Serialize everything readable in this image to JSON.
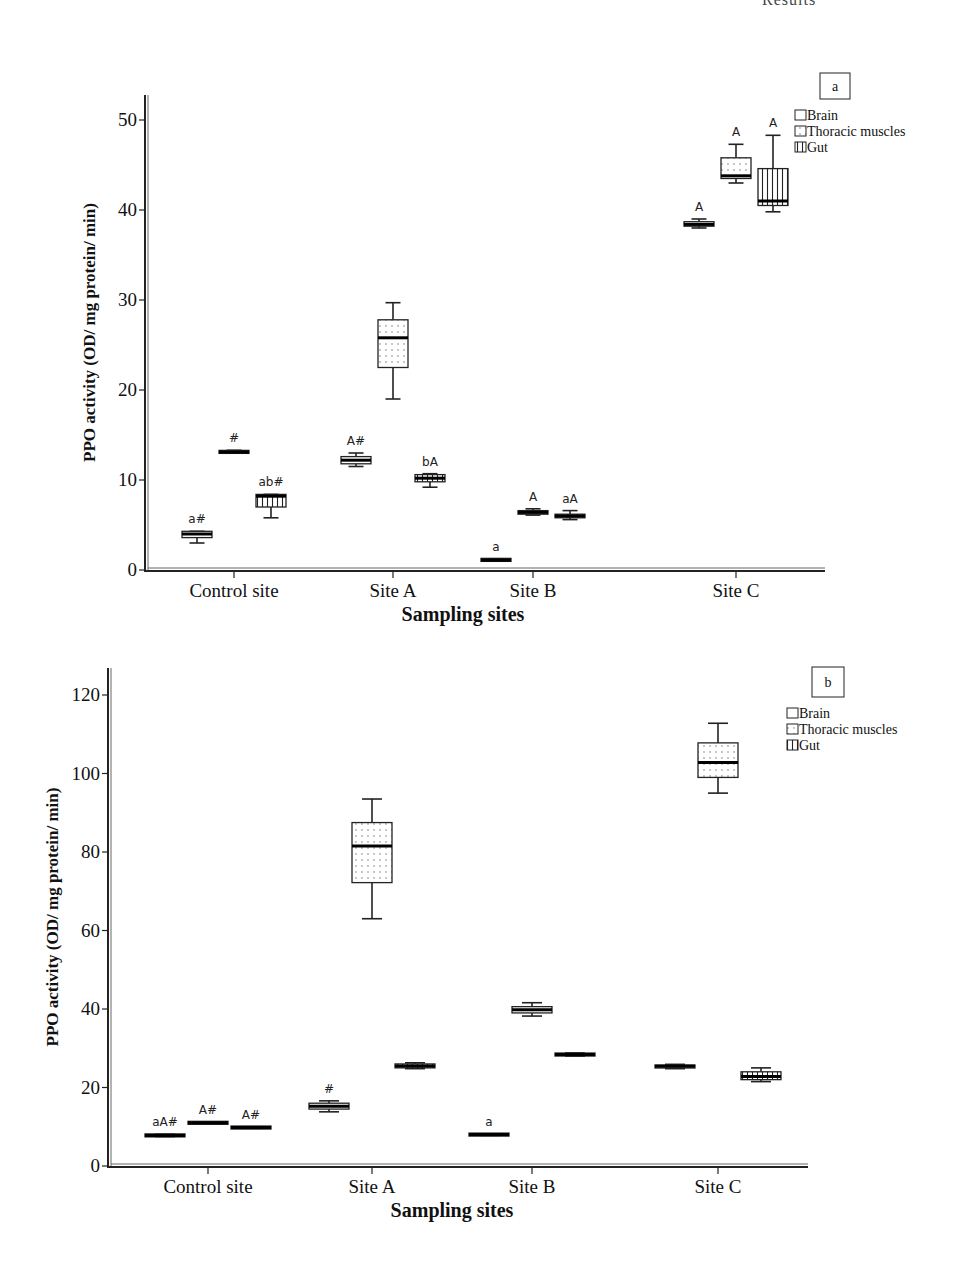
{
  "top_fragment": "Results",
  "chart_data": [
    {
      "panel": "a",
      "type": "box",
      "title": "",
      "xlabel": "Sampling sites",
      "ylabel": "PPO activity (OD/ mg protein/ min)",
      "ylim": [
        0,
        52
      ],
      "yticks": [
        0,
        10,
        20,
        30,
        40,
        50
      ],
      "categories": [
        "Control site",
        "Site A",
        "Site B",
        "Site C"
      ],
      "legend": [
        "Brain",
        "Thoracic muscles",
        "Gut"
      ],
      "legend_position": "upper right",
      "grid": false,
      "series": [
        {
          "name": "Brain",
          "pattern": "plain",
          "boxes": [
            {
              "category": "Control site",
              "min": 3.0,
              "q1": 3.6,
              "median": 4.0,
              "q3": 4.3,
              "max": 4.3,
              "annotation": "a#"
            },
            {
              "category": "Site A",
              "min": 11.5,
              "q1": 11.8,
              "median": 12.2,
              "q3": 12.6,
              "max": 13.0,
              "annotation": "A#"
            },
            {
              "category": "Site B",
              "min": 1.0,
              "q1": 1.05,
              "median": 1.1,
              "q3": 1.2,
              "max": 1.25,
              "annotation": "a"
            },
            {
              "category": "Site C",
              "min": 38.0,
              "q1": 38.2,
              "median": 38.4,
              "q3": 38.7,
              "max": 39.0,
              "annotation": "A"
            }
          ]
        },
        {
          "name": "Thoracic muscles",
          "pattern": "dotted",
          "boxes": [
            {
              "category": "Control site",
              "min": 13.0,
              "q1": 13.05,
              "median": 13.1,
              "q3": 13.2,
              "max": 13.3,
              "annotation": "#"
            },
            {
              "category": "Site A",
              "min": 19.0,
              "q1": 22.5,
              "median": 25.8,
              "q3": 27.8,
              "max": 29.7,
              "annotation": ""
            },
            {
              "category": "Site B",
              "min": 6.1,
              "q1": 6.2,
              "median": 6.4,
              "q3": 6.6,
              "max": 6.8,
              "annotation": "A"
            },
            {
              "category": "Site C",
              "min": 43.0,
              "q1": 43.5,
              "median": 43.8,
              "q3": 45.8,
              "max": 47.3,
              "annotation": "A"
            }
          ]
        },
        {
          "name": "Gut",
          "pattern": "vertical-lines",
          "boxes": [
            {
              "category": "Control site",
              "min": 5.8,
              "q1": 7.0,
              "median": 8.2,
              "q3": 8.4,
              "max": 8.4,
              "annotation": "ab#"
            },
            {
              "category": "Site A",
              "min": 9.2,
              "q1": 9.8,
              "median": 10.2,
              "q3": 10.6,
              "max": 10.7,
              "annotation": "bA"
            },
            {
              "category": "Site B",
              "min": 5.6,
              "q1": 5.8,
              "median": 6.0,
              "q3": 6.2,
              "max": 6.6,
              "annotation": "aA"
            },
            {
              "category": "Site C",
              "min": 39.8,
              "q1": 40.5,
              "median": 41.0,
              "q3": 44.6,
              "max": 48.3,
              "annotation": "A"
            }
          ]
        }
      ]
    },
    {
      "panel": "b",
      "type": "box",
      "title": "",
      "xlabel": "Sampling sites",
      "ylabel": "PPO activity (OD/ mg protein/ min)",
      "ylim": [
        0,
        125
      ],
      "yticks": [
        0,
        20,
        40,
        60,
        80,
        100,
        120
      ],
      "categories": [
        "Control site",
        "Site A",
        "Site B",
        "Site C"
      ],
      "legend": [
        "Brain",
        "Thoracic muscles",
        "Gut"
      ],
      "legend_position": "upper right",
      "grid": false,
      "series": [
        {
          "name": "Brain",
          "pattern": "plain",
          "boxes": [
            {
              "category": "Control site",
              "min": 7.5,
              "q1": 7.6,
              "median": 7.8,
              "q3": 8.0,
              "max": 8.1,
              "annotation": "aA#"
            },
            {
              "category": "Site A",
              "min": 13.8,
              "q1": 14.5,
              "median": 15.2,
              "q3": 16.0,
              "max": 16.6,
              "annotation": "#"
            },
            {
              "category": "Site B",
              "min": 7.8,
              "q1": 7.9,
              "median": 8.0,
              "q3": 8.1,
              "max": 8.2,
              "annotation": "a"
            },
            {
              "category": "Site C",
              "min": 24.8,
              "q1": 25.0,
              "median": 25.4,
              "q3": 25.7,
              "max": 25.9,
              "annotation": ""
            }
          ]
        },
        {
          "name": "Thoracic muscles",
          "pattern": "dotted",
          "boxes": [
            {
              "category": "Control site",
              "min": 10.8,
              "q1": 10.9,
              "median": 11.0,
              "q3": 11.1,
              "max": 11.2,
              "annotation": "A#"
            },
            {
              "category": "Site A",
              "min": 63.0,
              "q1": 72.2,
              "median": 81.5,
              "q3": 87.5,
              "max": 93.5,
              "annotation": ""
            },
            {
              "category": "Site B",
              "min": 38.2,
              "q1": 39.0,
              "median": 39.8,
              "q3": 40.6,
              "max": 41.6,
              "annotation": ""
            },
            {
              "category": "Site C",
              "min": 95.0,
              "q1": 99.0,
              "median": 102.8,
              "q3": 107.8,
              "max": 112.8,
              "annotation": ""
            }
          ]
        },
        {
          "name": "Gut",
          "pattern": "vertical-lines",
          "boxes": [
            {
              "category": "Control site",
              "min": 9.6,
              "q1": 9.7,
              "median": 9.8,
              "q3": 9.9,
              "max": 10.0,
              "annotation": "A#"
            },
            {
              "category": "Site A",
              "min": 24.8,
              "q1": 25.0,
              "median": 25.5,
              "q3": 26.0,
              "max": 26.3,
              "annotation": ""
            },
            {
              "category": "Site B",
              "min": 28.0,
              "q1": 28.1,
              "median": 28.4,
              "q3": 28.7,
              "max": 28.8,
              "annotation": ""
            },
            {
              "category": "Site C",
              "min": 21.5,
              "q1": 22.0,
              "median": 22.8,
              "q3": 24.0,
              "max": 25.0,
              "annotation": ""
            }
          ]
        }
      ]
    }
  ],
  "panels": [
    {
      "panel_label": "a",
      "layout": {
        "x0": 145,
        "x1": 825,
        "y0": 570,
        "ymax_px": 120,
        "ymax_val": 50,
        "top": 95,
        "cat_x": [
          234,
          393,
          533,
          736
        ],
        "offsets": [
          -37,
          0,
          37
        ],
        "box_w": 30,
        "label_box": [
          820,
          73,
          30,
          26
        ],
        "legend_xy": [
          795,
          120
        ]
      }
    },
    {
      "panel_label": "b",
      "layout": {
        "x0": 108,
        "x1": 808,
        "y0": 1166,
        "ymax_px": 695,
        "ymax_val": 120,
        "top": 668,
        "cat_x": [
          208,
          372,
          532,
          718
        ],
        "offsets": [
          -43,
          0,
          43
        ],
        "box_w": 40,
        "label_box": [
          812,
          667,
          32,
          30
        ],
        "legend_xy": [
          787,
          718
        ]
      }
    }
  ]
}
